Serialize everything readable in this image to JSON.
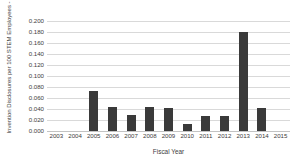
{
  "chart_data": {
    "type": "bar",
    "title": "",
    "xlabel": "Fiscal Year",
    "ylabel": "Invention Disclosures per 100 STEM Employees - DOT",
    "categories": [
      "2003",
      "2004",
      "2005",
      "2006",
      "2007",
      "2008",
      "2009",
      "2010",
      "2011",
      "2012",
      "2013",
      "2014",
      "2015"
    ],
    "values": [
      null,
      null,
      0.073,
      0.043,
      0.029,
      0.043,
      0.041,
      0.013,
      0.027,
      0.027,
      0.18,
      0.042,
      null
    ],
    "ylim": [
      0.0,
      0.2
    ],
    "ytick_step": 0.02,
    "ytick_labels": [
      "0.200",
      "0.180",
      "0.160",
      "0.140",
      "0.120",
      "0.100",
      "0.080",
      "0.060",
      "0.040",
      "0.020",
      "0.000"
    ],
    "ytick_values": [
      0.2,
      0.18,
      0.16,
      0.14,
      0.12,
      0.1,
      0.08,
      0.06,
      0.04,
      0.02,
      0.0
    ],
    "grid": true,
    "legend": false,
    "bar_color": "#3a3a3a",
    "gridline_color": "#d9d9d9",
    "background_color": "#ffffff"
  }
}
